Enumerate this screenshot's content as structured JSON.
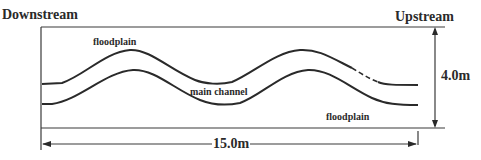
{
  "diagram": {
    "labels": {
      "downstream": "Downstream",
      "upstream": "Upstream",
      "floodplain_top": "floodplain",
      "floodplain_bottom": "floodplain",
      "main_channel": "main channel"
    },
    "dimensions": {
      "width": "15.0m",
      "height": "4.0m"
    },
    "colors": {
      "line": "#2a2a2a",
      "background": "#ffffff"
    }
  }
}
